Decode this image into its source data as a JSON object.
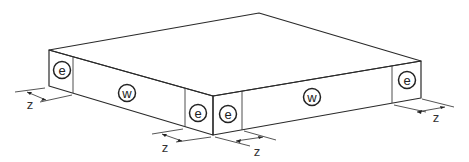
{
  "diagram": {
    "title": "",
    "colors": {
      "stroke": "#2a2a2a",
      "background": "#ffffff"
    },
    "slab": {
      "top_vertex": [
        259,
        13
      ],
      "left_vertex_top": [
        49,
        50
      ],
      "left_vertex_bottom": [
        49,
        86
      ],
      "front_vertex_top": [
        213,
        96
      ],
      "front_vertex_bottom": [
        213,
        135
      ],
      "right_vertex_top": [
        421,
        61
      ],
      "right_vertex_bottom": [
        421,
        98
      ]
    },
    "zones": [
      {
        "id": "left-end",
        "label": "e",
        "cx": 62,
        "cy": 70
      },
      {
        "id": "left-middle",
        "label": "w",
        "cx": 127,
        "cy": 93
      },
      {
        "id": "left-corner",
        "label": "e",
        "cx": 198,
        "cy": 113
      },
      {
        "id": "right-corner",
        "label": "e",
        "cx": 228,
        "cy": 114
      },
      {
        "id": "right-middle",
        "label": "w",
        "cx": 312,
        "cy": 97
      },
      {
        "id": "right-end",
        "label": "e",
        "cx": 407,
        "cy": 80
      }
    ],
    "dimensions": [
      {
        "id": "dim-left",
        "label": "z",
        "x": 30,
        "y": 104
      },
      {
        "id": "dim-front-left",
        "label": "z",
        "x": 165,
        "y": 147
      },
      {
        "id": "dim-front-right",
        "label": "z",
        "x": 257,
        "y": 151
      },
      {
        "id": "dim-right",
        "label": "z",
        "x": 436,
        "y": 117
      }
    ]
  }
}
